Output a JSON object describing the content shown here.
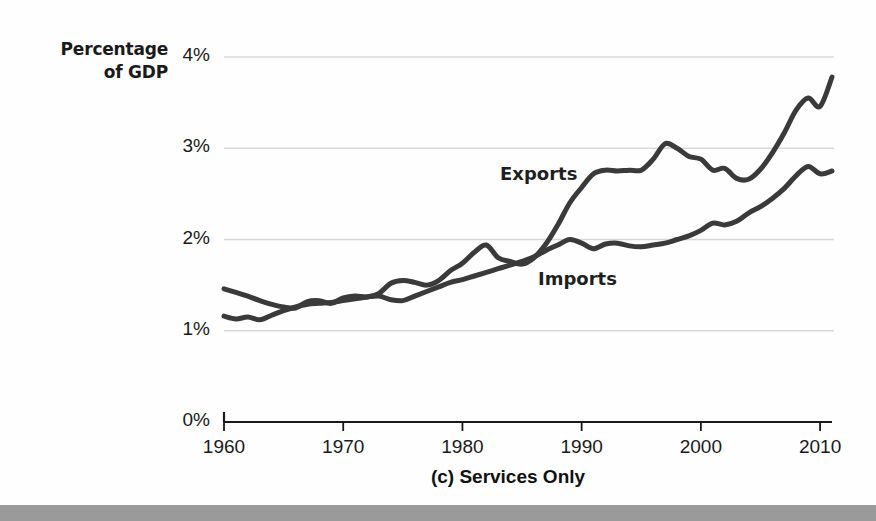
{
  "figure": {
    "axis_title_line1": "Percentage",
    "axis_title_line2": "of GDP",
    "caption": "(c) Services Only",
    "background_color": "#fefefe",
    "bottom_bar_color": "#9a9a9a",
    "line_color": "#3a3a3a",
    "axis_color": "#1a1a1a",
    "gridline_color": "#d8d8d8"
  },
  "labels": {
    "exports": "Exports",
    "imports": "Imports"
  },
  "chart_data": {
    "type": "line",
    "title": "(c) Services Only",
    "xlabel": "",
    "ylabel": "Percentage of GDP",
    "xlim": [
      1960,
      2011
    ],
    "ylim": [
      0,
      4
    ],
    "xticks": [
      1960,
      1970,
      1980,
      1990,
      2000,
      2010
    ],
    "xtick_labels": [
      "1960",
      "1970",
      "1980",
      "1990",
      "2000",
      "2010"
    ],
    "yticks": [
      0,
      1,
      2,
      3,
      4
    ],
    "ytick_labels": [
      "0%",
      "1%",
      "2%",
      "3%",
      "4%"
    ],
    "grid": "horizontal",
    "legend": "inline-annotations",
    "units": "percent of GDP",
    "x": [
      1960,
      1961,
      1962,
      1963,
      1964,
      1965,
      1966,
      1967,
      1968,
      1969,
      1970,
      1971,
      1972,
      1973,
      1974,
      1975,
      1976,
      1977,
      1978,
      1979,
      1980,
      1981,
      1982,
      1983,
      1984,
      1985,
      1986,
      1987,
      1988,
      1989,
      1990,
      1991,
      1992,
      1993,
      1994,
      1995,
      1996,
      1997,
      1998,
      1999,
      2000,
      2001,
      2002,
      2003,
      2004,
      2005,
      2006,
      2007,
      2008,
      2009,
      2010,
      2011
    ],
    "series": [
      {
        "name": "Exports",
        "color": "#3a3a3a",
        "values": [
          1.46,
          1.42,
          1.38,
          1.33,
          1.29,
          1.26,
          1.25,
          1.32,
          1.33,
          1.3,
          1.36,
          1.38,
          1.37,
          1.41,
          1.52,
          1.55,
          1.53,
          1.5,
          1.55,
          1.66,
          1.74,
          1.86,
          1.94,
          1.8,
          1.76,
          1.73,
          1.8,
          1.95,
          2.16,
          2.4,
          2.57,
          2.72,
          2.76,
          2.75,
          2.76,
          2.76,
          2.88,
          3.05,
          3.0,
          2.91,
          2.88,
          2.76,
          2.78,
          2.67,
          2.66,
          2.77,
          2.95,
          3.17,
          3.42,
          3.55,
          3.46,
          3.78
        ]
      },
      {
        "name": "Imports",
        "color": "#3a3a3a",
        "values": [
          1.16,
          1.13,
          1.15,
          1.12,
          1.17,
          1.22,
          1.26,
          1.29,
          1.3,
          1.31,
          1.33,
          1.35,
          1.37,
          1.38,
          1.34,
          1.33,
          1.38,
          1.43,
          1.48,
          1.53,
          1.56,
          1.6,
          1.64,
          1.68,
          1.72,
          1.76,
          1.81,
          1.88,
          1.94,
          2.0,
          1.96,
          1.9,
          1.95,
          1.96,
          1.93,
          1.92,
          1.94,
          1.96,
          2.0,
          2.04,
          2.1,
          2.18,
          2.16,
          2.2,
          2.29,
          2.36,
          2.45,
          2.56,
          2.7,
          2.8,
          2.72,
          2.75
        ]
      }
    ],
    "annotations": [
      {
        "text": "Exports",
        "series": "Exports",
        "x": 1988,
        "y": 2.65
      },
      {
        "text": "Imports",
        "series": "Imports",
        "x": 1991,
        "y": 1.55
      }
    ]
  }
}
